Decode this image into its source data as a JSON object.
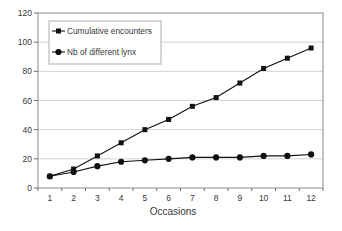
{
  "figure": {
    "background": "#ffffff"
  },
  "chart_data": {
    "type": "line",
    "title": "",
    "xlabel": "Occasions",
    "ylabel": "",
    "categories": [
      1,
      2,
      3,
      4,
      5,
      6,
      7,
      8,
      9,
      10,
      11,
      12
    ],
    "series": [
      {
        "name": "Cumulative encounters",
        "marker": "square",
        "color": "#111111",
        "values": [
          8,
          13,
          22,
          31,
          40,
          47,
          56,
          62,
          72,
          82,
          89,
          96
        ]
      },
      {
        "name": "Nb of different lynx",
        "marker": "circle",
        "color": "#111111",
        "values": [
          8,
          11,
          15,
          18,
          19,
          20,
          21,
          21,
          21,
          22,
          22,
          23
        ]
      }
    ],
    "ylim": [
      0,
      120
    ],
    "yticks": [
      0,
      20,
      40,
      60,
      80,
      100,
      120
    ],
    "grid": "horizontal-only",
    "legend_position": "top-left-inside",
    "style": {
      "plot_background": "#ffffff",
      "gridline_color": "#d2d2d2",
      "frame_color": "#8a8a8a",
      "tick_color": "#6e6e6e",
      "text_color": "#383838",
      "line_color": "#111111",
      "legend_border_color": "#ababab",
      "legend_fill": "#ffffff"
    }
  }
}
